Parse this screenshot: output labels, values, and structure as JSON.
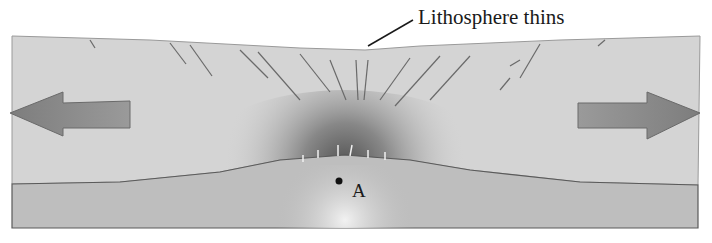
{
  "diagram": {
    "labels": {
      "callout": "Lithosphere thins",
      "point": "A"
    },
    "elements": {
      "lithosphere_block": "upper lithosphere slab with faults",
      "asthenosphere_layer": "lower asthenosphere layer bulging upward",
      "left_arrow": "extension direction left",
      "right_arrow": "extension direction right",
      "point_marker": "point A in asthenosphere below rift"
    },
    "colors": {
      "lithosphere": "#c8c8c8",
      "lithosphere_dark": "#6e6e6e",
      "asthenosphere": "#bdbdbd",
      "arrow": "#8a8a8a",
      "ink": "#1a1a1a",
      "background": "#ffffff"
    }
  }
}
